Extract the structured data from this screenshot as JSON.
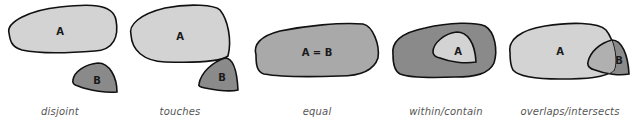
{
  "diagram": {
    "type": "spatial-relationships",
    "colors": {
      "light_fill": "#d3d3d3",
      "dark_fill": "#8a8a8a",
      "mid_fill": "#a9a9a9",
      "overlap_fill": "#b0b0b0",
      "stroke": "#111111",
      "caption": "#555555"
    },
    "panels": [
      {
        "id": "disjoint",
        "caption": "disjoint",
        "shapes": [
          {
            "label": "A",
            "fill": "light"
          },
          {
            "label": "B",
            "fill": "dark"
          }
        ]
      },
      {
        "id": "touches",
        "caption": "touches",
        "shapes": [
          {
            "label": "A",
            "fill": "light"
          },
          {
            "label": "B",
            "fill": "dark"
          }
        ]
      },
      {
        "id": "equal",
        "caption": "equal",
        "shapes": [
          {
            "label": "A = B",
            "fill": "mid"
          }
        ]
      },
      {
        "id": "within",
        "caption": "within/contain",
        "shapes": [
          {
            "label": "",
            "fill": "dark"
          },
          {
            "label": "A",
            "fill": "light"
          }
        ]
      },
      {
        "id": "overlaps",
        "caption": "overlaps/intersects",
        "shapes": [
          {
            "label": "A",
            "fill": "light"
          },
          {
            "label": "B",
            "fill": "dark"
          }
        ]
      }
    ]
  }
}
